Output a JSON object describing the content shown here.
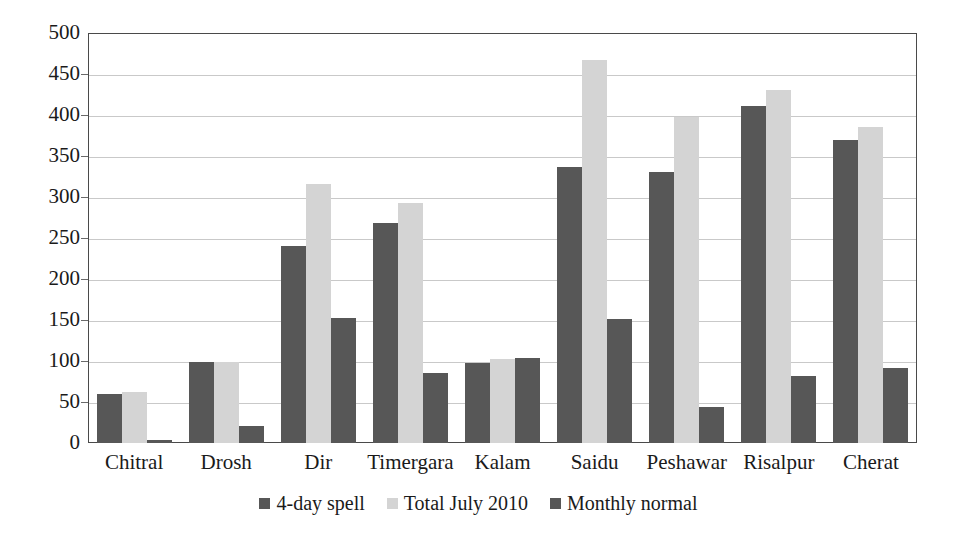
{
  "chart_data": {
    "type": "bar",
    "title": "",
    "subtitle": "",
    "xlabel": "",
    "ylabel": "",
    "ylim": [
      0,
      500
    ],
    "ytick_step": 50,
    "yticks": [
      0,
      50,
      100,
      150,
      200,
      250,
      300,
      350,
      400,
      450,
      500
    ],
    "grid": true,
    "legend_position": "bottom",
    "categories": [
      "Chitral",
      "Drosh",
      "Dir",
      "Timergara",
      "Kalam",
      "Saidu",
      "Peshawar",
      "Risalpur",
      "Cherat"
    ],
    "series": [
      {
        "name": "4-day spell",
        "color": "#575757",
        "values": [
          60,
          99,
          240,
          268,
          97,
          337,
          330,
          411,
          369
        ]
      },
      {
        "name": "Total July 2010",
        "color": "#d4d4d4",
        "values": [
          62,
          99,
          316,
          293,
          103,
          467,
          397,
          430,
          385
        ]
      },
      {
        "name": "Monthly normal",
        "color": "#575757",
        "values": [
          4,
          21,
          153,
          85,
          104,
          151,
          44,
          82,
          91
        ]
      }
    ]
  },
  "axis": {
    "tick_labels": [
      "500",
      "450",
      "400",
      "350",
      "300",
      "250",
      "200",
      "150",
      "100",
      "50",
      "0"
    ]
  },
  "colors": {
    "series_dark": "#575757",
    "series_light": "#d4d4d4",
    "gridline": "#c9c9c9",
    "frame": "#4a4a4a",
    "text": "#1a1a1a",
    "background": "#ffffff"
  }
}
